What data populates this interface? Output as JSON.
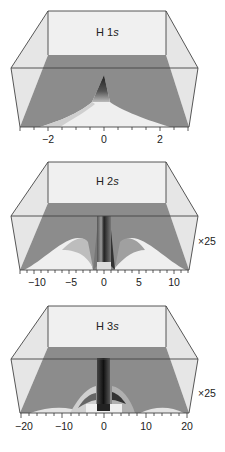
{
  "figure": {
    "panels": [
      {
        "id": "h1s",
        "title_prefix": "H 1",
        "title_orbital": "s",
        "scale_label": "",
        "x_ticks": [
          "−2",
          "0",
          "2"
        ],
        "x_range": [
          -3,
          3
        ]
      },
      {
        "id": "h2s",
        "title_prefix": "H 2",
        "title_orbital": "s",
        "scale_label": "×25",
        "x_ticks": [
          "−10",
          "−5",
          "0",
          "5",
          "10"
        ],
        "x_range": [
          -12,
          12
        ]
      },
      {
        "id": "h3s",
        "title_prefix": "H 3",
        "title_orbital": "s",
        "scale_label": "×25",
        "x_ticks": [
          "−20",
          "−10",
          "0",
          "10",
          "20"
        ],
        "x_range": [
          -20,
          20
        ]
      }
    ]
  },
  "colors": {
    "floor": "#8a8a8a",
    "wall": "#ededed",
    "frame": "#444444",
    "surface_light": "#f2f2f2",
    "surface_dark": "#1e1e1e"
  }
}
